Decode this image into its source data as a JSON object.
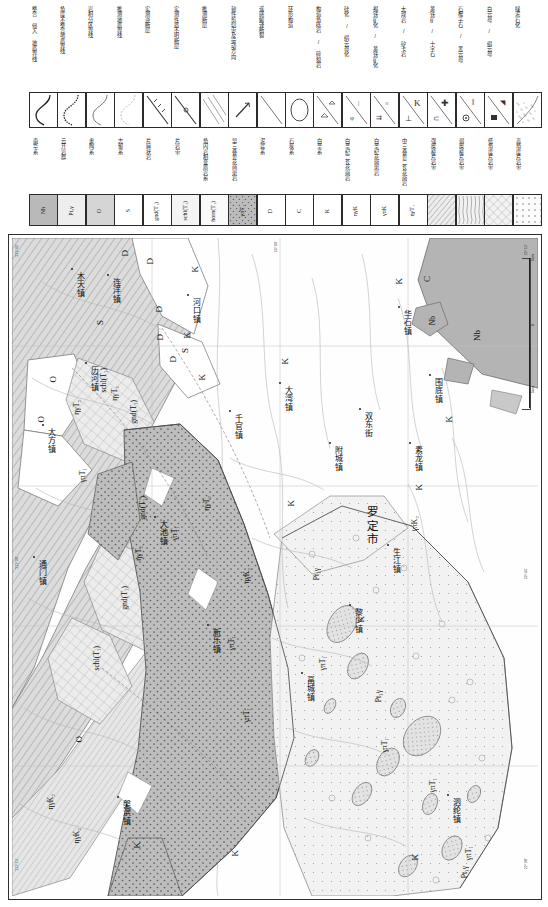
{
  "legend_structural": {
    "items": [
      {
        "label": "整合 侵入 地质界线",
        "symbol": "s-curve-solid"
      },
      {
        "label": "角度不整合地质界线",
        "symbol": "s-curve-dotted"
      },
      {
        "label": "岩相分区界线",
        "symbol": "s-curve-thin"
      },
      {
        "label": "推测地质界线",
        "symbol": "s-curve-light"
      },
      {
        "label": "实测逆断层",
        "symbol": "fault-reverse"
      },
      {
        "label": "实测性质不明断层",
        "symbol": "fault-unknown"
      },
      {
        "label": "推测断层",
        "symbol": "fault-inferred"
      },
      {
        "label": "韧性剪切带及运动方向",
        "symbol": "shear-zone"
      },
      {
        "label": "遥感解译断裂",
        "symbol": "remote-fault"
      },
      {
        "label": "环形构造",
        "symbol": "ring-structure"
      },
      {
        "label": "构造角砾岩 / 碎裂岩",
        "symbol": "breccia"
      },
      {
        "label": "硅化 / 绢云母化",
        "symbol": "silicification"
      },
      {
        "label": "褐铁矿化 / 黄铁矿化",
        "symbol": "limonite"
      },
      {
        "label": "大理岩 / 矽卡岩",
        "symbol": "marble-skarn"
      },
      {
        "label": "黄铁矿 / 十字石",
        "symbol": "pyrite"
      },
      {
        "label": "石榴子石 / 黑云母",
        "symbol": "garnet"
      },
      {
        "label": "白云母 / 绢云母",
        "symbol": "muscovite"
      },
      {
        "label": "绿泥石化",
        "symbol": "chlorite"
      }
    ]
  },
  "legend_units": {
    "items": [
      {
        "code": "Nh",
        "label": "南华系",
        "fill": "#b9b9b9",
        "pattern": "none"
      },
      {
        "code": "Pt₃γ",
        "label": "云开岩群",
        "fill": "#eeeeee",
        "pattern": "none"
      },
      {
        "code": "O",
        "label": "奥陶系",
        "fill": "#d5d5d5",
        "pattern": "none"
      },
      {
        "code": "S",
        "label": "志留系",
        "fill": "#ffffff",
        "pattern": "none"
      },
      {
        "code": "gnd(T₁)",
        "label": "片麻状岩",
        "fill": "#ffffff",
        "pattern": "none"
      },
      {
        "code": "schl(T₁)",
        "label": "片岩带",
        "fill": "#f4f4f4",
        "pattern": "none"
      },
      {
        "code": "horn(T₁)",
        "label": "角闪岩相变质岩系",
        "fill": "#fafafa",
        "pattern": "none"
      },
      {
        "code": "γπT₁",
        "label": "早三叠世花岗斑岩",
        "fill": "#bcbcbc",
        "pattern": "dots"
      },
      {
        "code": "D",
        "label": "泥盆系",
        "fill": "#ffffff",
        "pattern": "none"
      },
      {
        "code": "C",
        "label": "石炭系",
        "fill": "#ffffff",
        "pattern": "none"
      },
      {
        "code": "K",
        "label": "白垩系",
        "fill": "#ffffff",
        "pattern": "none"
      },
      {
        "code": "ηγK",
        "label": "白垩纪二长花岗岩",
        "fill": "#ffffff",
        "pattern": "none"
      },
      {
        "code": "γπK",
        "label": "白垩纪花岗斑岩",
        "fill": "#ffffff",
        "pattern": "none"
      },
      {
        "code": "ηγT₁",
        "label": "中三叠世二长花岗岩",
        "fill": "#ffffff",
        "pattern": "none"
      },
      {
        "code": "",
        "label": "强糜棱片岩带",
        "fill": "#ededed",
        "pattern": "diag"
      },
      {
        "code": "",
        "label": "弱糜棱片岩带",
        "fill": "#f2f2f2",
        "pattern": "wavy"
      },
      {
        "code": "",
        "label": "低角度片岩带",
        "fill": "#f6f6f6",
        "pattern": "cross"
      },
      {
        "code": "",
        "label": "高角度片岩带",
        "fill": "#fbfbfb",
        "pattern": "dotgrid"
      }
    ]
  },
  "map": {
    "scale_bar": {
      "left": "5km",
      "zero": "0",
      "right": "5km"
    },
    "coords": [
      {
        "text": "111°45'",
        "x": 3,
        "y": 6
      },
      {
        "text": "111°30'",
        "x": 3,
        "y": 318
      },
      {
        "text": "111°15'",
        "x": 3,
        "y": 620
      },
      {
        "text": "22°52'",
        "x": 512,
        "y": 6
      },
      {
        "text": "22°45'",
        "x": 512,
        "y": 330
      },
      {
        "text": "22°38'",
        "x": 512,
        "y": 620
      },
      {
        "text": "23°00'",
        "x": 262,
        "y": 3
      }
    ],
    "city": {
      "name": "罗定市",
      "x": 352,
      "y": 268
    },
    "towns": [
      {
        "name": "木天镇",
        "x": 62,
        "y": 34
      },
      {
        "name": "连洋镇",
        "x": 98,
        "y": 40
      },
      {
        "name": "历河镇",
        "x": 76,
        "y": 128
      },
      {
        "name": "河口镇",
        "x": 178,
        "y": 60
      },
      {
        "name": "大方镇",
        "x": 33,
        "y": 190
      },
      {
        "name": "大湾镇",
        "x": 270,
        "y": 148
      },
      {
        "name": "千官镇",
        "x": 220,
        "y": 176
      },
      {
        "name": "大池镇",
        "x": 145,
        "y": 282
      },
      {
        "name": "华石镇",
        "x": 389,
        "y": 72
      },
      {
        "name": "围底镇",
        "x": 420,
        "y": 140
      },
      {
        "name": "双东街",
        "x": 350,
        "y": 174
      },
      {
        "name": "附城镇",
        "x": 320,
        "y": 208
      },
      {
        "name": "素龙镇",
        "x": 400,
        "y": 208
      },
      {
        "name": "新乐镇",
        "x": 198,
        "y": 390
      },
      {
        "name": "黎少镇",
        "x": 340,
        "y": 370
      },
      {
        "name": "生江镇",
        "x": 378,
        "y": 310
      },
      {
        "name": "畐城镇",
        "x": 292,
        "y": 438
      },
      {
        "name": "泗纶镇",
        "x": 438,
        "y": 560
      },
      {
        "name": "槃滨镇",
        "x": 108,
        "y": 562
      },
      {
        "name": "通门镇",
        "x": 24,
        "y": 322
      }
    ],
    "codes": [
      {
        "text": "D",
        "x": 108,
        "y": 12,
        "big": true
      },
      {
        "text": "D",
        "x": 133,
        "y": 20,
        "big": true
      },
      {
        "text": "D",
        "x": 142,
        "y": 68,
        "big": true
      },
      {
        "text": "D",
        "x": 143,
        "y": 96,
        "big": true
      },
      {
        "text": "D",
        "x": 156,
        "y": 118,
        "big": true
      },
      {
        "text": "S",
        "x": 83,
        "y": 82,
        "big": true
      },
      {
        "text": "S",
        "x": 168,
        "y": 110,
        "big": true
      },
      {
        "text": "K",
        "x": 178,
        "y": 28,
        "big": true
      },
      {
        "text": "K",
        "x": 170,
        "y": 94,
        "big": true
      },
      {
        "text": "K",
        "x": 185,
        "y": 136,
        "big": true
      },
      {
        "text": "K",
        "x": 268,
        "y": 120,
        "big": true
      },
      {
        "text": "C",
        "x": 410,
        "y": 38,
        "big": true
      },
      {
        "text": "K",
        "x": 382,
        "y": 40,
        "big": true
      },
      {
        "text": "Nb",
        "x": 416,
        "y": 78,
        "big": false
      },
      {
        "text": "Nb",
        "x": 460,
        "y": 92,
        "big": true
      },
      {
        "text": "K",
        "x": 432,
        "y": 178,
        "big": true
      },
      {
        "text": "O",
        "x": 36,
        "y": 138,
        "big": true
      },
      {
        "text": "O",
        "x": 24,
        "y": 178,
        "big": true
      },
      {
        "text": "O",
        "x": 62,
        "y": 498,
        "big": true
      },
      {
        "text": "schl(T₁)",
        "x": 87,
        "y": 130,
        "big": false
      },
      {
        "text": "schl(T₁)",
        "x": 80,
        "y": 408,
        "big": false
      },
      {
        "text": "gnd(T₁)",
        "x": 117,
        "y": 162,
        "big": false
      },
      {
        "text": "gnd(T₁)",
        "x": 108,
        "y": 348,
        "big": false
      },
      {
        "text": "gnd(T₁)",
        "x": 126,
        "y": 258,
        "big": false
      },
      {
        "text": "ηγT₂",
        "x": 60,
        "y": 162,
        "big": false
      },
      {
        "text": "ηγT₂",
        "x": 98,
        "y": 148,
        "big": false
      },
      {
        "text": "ηγT₂",
        "x": 190,
        "y": 258,
        "big": false
      },
      {
        "text": "ηγT₂",
        "x": 122,
        "y": 308,
        "big": false
      },
      {
        "text": "γπT₁",
        "x": 66,
        "y": 230,
        "big": false
      },
      {
        "text": "γπT₁",
        "x": 158,
        "y": 288,
        "big": false
      },
      {
        "text": "γπT₁",
        "x": 215,
        "y": 398,
        "big": false
      },
      {
        "text": "γπT₁",
        "x": 230,
        "y": 470,
        "big": false
      },
      {
        "text": "γπT₁",
        "x": 306,
        "y": 418,
        "big": false
      },
      {
        "text": "γπT₁",
        "x": 368,
        "y": 500,
        "big": false
      },
      {
        "text": "γπT₁",
        "x": 416,
        "y": 540,
        "big": false
      },
      {
        "text": "γπT₁",
        "x": 452,
        "y": 608,
        "big": false
      },
      {
        "text": "ηγK₂",
        "x": 230,
        "y": 330,
        "big": false
      },
      {
        "text": "ηγK₂",
        "x": 34,
        "y": 556,
        "big": false
      },
      {
        "text": "ηγK₂",
        "x": 60,
        "y": 590,
        "big": false
      },
      {
        "text": "γπK₂",
        "x": 398,
        "y": 278,
        "big": false
      },
      {
        "text": "Pt₃γ",
        "x": 300,
        "y": 330,
        "big": false
      },
      {
        "text": "Pt₃γ",
        "x": 362,
        "y": 452,
        "big": false
      },
      {
        "text": "Pt₃γ",
        "x": 448,
        "y": 628,
        "big": false
      },
      {
        "text": "K",
        "x": 274,
        "y": 262,
        "big": true
      },
      {
        "text": "K",
        "x": 344,
        "y": 378,
        "big": true
      },
      {
        "text": "K",
        "x": 402,
        "y": 246,
        "big": true
      },
      {
        "text": "K",
        "x": 398,
        "y": 616,
        "big": true
      },
      {
        "text": "K",
        "x": 120,
        "y": 604,
        "big": true
      },
      {
        "text": "K",
        "x": 218,
        "y": 612,
        "big": true
      }
    ]
  }
}
